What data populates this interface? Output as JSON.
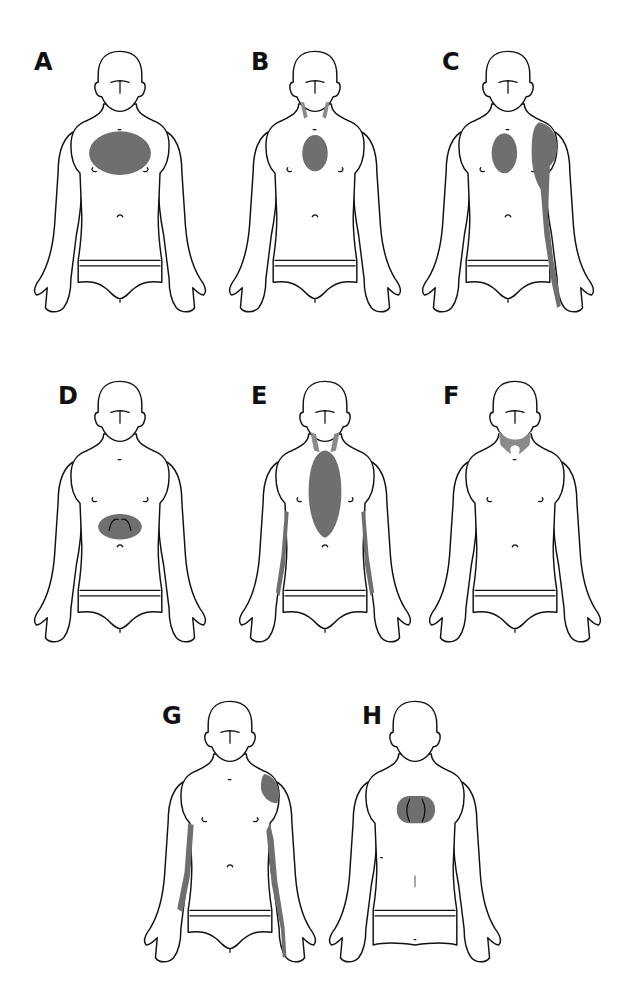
{
  "figure": {
    "title": "",
    "shade_color": "#6f6f6f",
    "outline_color": "#111111",
    "background": "#ffffff"
  },
  "panels": [
    {
      "id": "A",
      "label": "A",
      "view": "front",
      "x": 20,
      "y": 30,
      "label_x": 40,
      "label_y": 18,
      "zones": [
        "chest-wide"
      ]
    },
    {
      "id": "B",
      "label": "B",
      "view": "front",
      "x": 215,
      "y": 30,
      "label_x": 42,
      "label_y": 18,
      "zones": [
        "chest-central",
        "neck-sides"
      ]
    },
    {
      "id": "C",
      "label": "C",
      "view": "front",
      "x": 408,
      "y": 30,
      "label_x": 40,
      "label_y": 18,
      "zones": [
        "chest-central",
        "left-shoulder",
        "left-arm-inner"
      ]
    },
    {
      "id": "D",
      "label": "D",
      "view": "front",
      "x": 20,
      "y": 360,
      "label_x": 40,
      "label_y": 22,
      "zones": [
        "epigastric"
      ]
    },
    {
      "id": "E",
      "label": "E",
      "view": "front",
      "x": 225,
      "y": 360,
      "label_x": 32,
      "label_y": 22,
      "zones": [
        "chest-elongated",
        "neck-sides",
        "both-arms-inner"
      ]
    },
    {
      "id": "F",
      "label": "F",
      "view": "front",
      "x": 415,
      "y": 360,
      "label_x": 33,
      "label_y": 22,
      "zones": [
        "jaw-neck"
      ]
    },
    {
      "id": "G",
      "label": "G",
      "view": "front",
      "x": 130,
      "y": 680,
      "label_x": 38,
      "label_y": 22,
      "zones": [
        "left-shoulder-small",
        "both-arms-inner-long"
      ]
    },
    {
      "id": "H",
      "label": "H",
      "view": "back",
      "x": 315,
      "y": 680,
      "label_x": 47,
      "label_y": 22,
      "zones": [
        "interscapular"
      ]
    }
  ]
}
